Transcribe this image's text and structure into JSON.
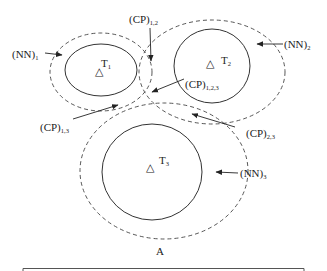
{
  "diagram": {
    "caption": "A",
    "targets": [
      {
        "label": "T",
        "sub": "1",
        "marker": "△"
      },
      {
        "label": "T",
        "sub": "2",
        "marker": "△"
      },
      {
        "label": "T",
        "sub": "3",
        "marker": "△"
      }
    ],
    "neighborhoods": [
      {
        "label": "(NN)",
        "sub": "1"
      },
      {
        "label": "(NN)",
        "sub": "2"
      },
      {
        "label": "(NN)",
        "sub": "3"
      }
    ],
    "common_parts": [
      {
        "label": "(CP)",
        "sub": "1,2"
      },
      {
        "label": "(CP)",
        "sub": "1,2,3"
      },
      {
        "label": "(CP)",
        "sub": "1,3"
      },
      {
        "label": "(CP)",
        "sub": "2,3"
      }
    ]
  }
}
